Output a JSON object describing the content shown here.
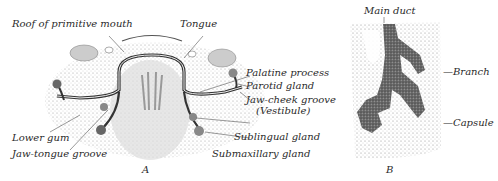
{
  "figure_a": {
    "letter": "A",
    "labels": {
      "roof": "Roof of primitive mouth",
      "tongue": "Tongue",
      "palatine": "Palatine process",
      "parotid": "Parotid gland",
      "jaw_cheek": "Jaw-cheek groove",
      "vestibule": "(Vestibule)",
      "lower_gum": "Lower gum",
      "jaw_tongue": "Jaw-tongue groove",
      "sublingual": "Sublingual gland",
      "submaxillary": "Submaxillary gland"
    }
  },
  "figure_b": {
    "letter": "B",
    "labels": {
      "main_duct": "Main duct",
      "branch": "—Branch",
      "capsule": "—Capsule"
    }
  }
}
